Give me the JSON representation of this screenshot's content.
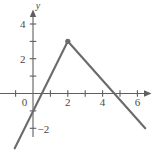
{
  "figure": {
    "background_color": "#ffffff",
    "width": 154,
    "height": 154
  },
  "chart_data": {
    "type": "line",
    "title": "",
    "subtitle": "",
    "xlabel": "",
    "ylabel": "y",
    "axis_labels": {
      "x_axis_name": "",
      "y_axis_name": "y"
    },
    "grid": false,
    "legend": null,
    "legend_position": "none",
    "xlim": [
      -1.9,
      7.0
    ],
    "ylim": [
      -3.5,
      4.9
    ],
    "xticks": [
      0,
      1,
      2,
      3,
      4,
      5,
      6
    ],
    "yticks": [
      -2,
      -1,
      1,
      2,
      3,
      4
    ],
    "xtick_labels": [
      {
        "value": 0,
        "text": "0"
      },
      {
        "value": 2,
        "text": "2"
      },
      {
        "value": 4,
        "text": "4"
      },
      {
        "value": 6,
        "text": "6"
      }
    ],
    "ytick_labels": [
      {
        "value": 4,
        "text": "4"
      },
      {
        "value": 2,
        "text": "2"
      },
      {
        "value": -2,
        "text": "−2"
      }
    ],
    "series": [
      {
        "name": "piecewise-linear",
        "color": "#6b6b6b",
        "line_width": 2.1,
        "points": [
          {
            "x": -1.05,
            "y": -3.15
          },
          {
            "x": 2.0,
            "y": 3.0
          },
          {
            "x": 6.45,
            "y": -2.0
          }
        ]
      }
    ],
    "markers": [
      {
        "name": "vertex-point",
        "x": 2.0,
        "y": 3.0,
        "color": "#6b6b6b",
        "radius": 2.6
      }
    ],
    "annotations": [],
    "colors": {
      "curve": "#6b6b6b",
      "axis": "#5f5f5f",
      "text": "#4a4a4a",
      "background": "#ffffff"
    },
    "geometry": {
      "origin_px": {
        "x": 33.0,
        "y": 93.5
      },
      "unit_px": {
        "x": 17.4,
        "y": 17.4
      },
      "x_axis_extent_units": [
        -1.9,
        6.9
      ],
      "y_axis_extent_units": [
        -2.6,
        4.5
      ]
    }
  }
}
